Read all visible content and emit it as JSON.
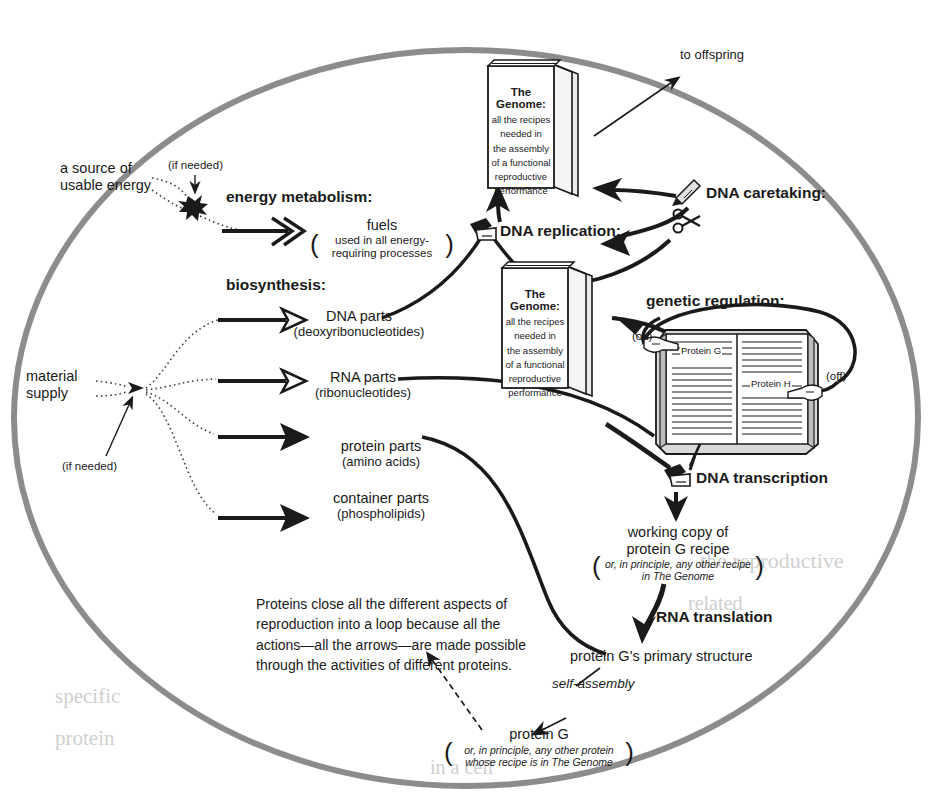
{
  "diagram": {
    "membrane_color": "#8c8c8c",
    "ink_color": "#1a1a1a"
  },
  "labels": {
    "to_offspring": "to offspring",
    "source_energy_l1": "a source of",
    "source_energy_l2": "usable energy",
    "if_needed_energy": "(if needed)",
    "energy_metabolism": "energy metabolism:",
    "biosynthesis": "biosynthesis:",
    "material_supply_l1": "material",
    "material_supply_l2": "supply",
    "if_needed_material": "(if needed)",
    "dna_replication": "DNA replication:",
    "dna_caretaking": "DNA caretaking:",
    "genetic_regulation": "genetic regulation:",
    "dna_transcription": "DNA transcription",
    "rna_translation": "RNA translation",
    "self_assembly": "self-assembly",
    "on": "(on)",
    "off": "(off)",
    "protein_g_page": "Protein G",
    "protein_h_page": "Protein H"
  },
  "products": [
    {
      "name": "fuels",
      "sub_l1": "used in all energy-",
      "sub_l2": "requiring processes",
      "arrow": "double-chevron"
    },
    {
      "name": "DNA parts",
      "sub_l1": "(deoxyribonucleotides)",
      "sub_l2": "",
      "arrow": "open-head"
    },
    {
      "name": "RNA parts",
      "sub_l1": "(ribonucleotides)",
      "sub_l2": "",
      "arrow": "open-head"
    },
    {
      "name": "protein parts",
      "sub_l1": "(amino acids)",
      "sub_l2": "",
      "arrow": "solid-head"
    },
    {
      "name": "container parts",
      "sub_l1": "(phospholipids)",
      "sub_l2": "",
      "arrow": "solid-head"
    }
  ],
  "genome_book": {
    "title": "The Genome:",
    "lines": [
      "all the recipes",
      "needed in",
      "the assembly",
      "of a functional",
      "reproductive",
      "performance"
    ]
  },
  "transcription_chain": {
    "working_copy_l1": "working copy of",
    "working_copy_l2": "protein G recipe",
    "working_copy_paren_l1": "or, in principle, any other recipe",
    "working_copy_paren_l2": "in The Genome",
    "primary_structure": "protein G's primary structure",
    "protein_g": "protein G",
    "protein_g_paren_l1": "or, in principle, any other protein",
    "protein_g_paren_l2": "whose recipe is in The Genome"
  },
  "note": {
    "line1": "Proteins close all the different aspects of",
    "line2": "reproduction into a loop because all the",
    "line3": "actions—all the arrows—are made possible",
    "line4": "through the activities of different proteins."
  },
  "icons": {
    "writing_hand": "writing-hand-icon",
    "pencil": "pencil-icon",
    "scissors": "scissors-icon",
    "pointing_hand_on": "pointing-hand-icon",
    "pointing_hand_off": "pointing-hand-icon"
  },
  "bleed_text": [
    {
      "t": "the reproductive",
      "x": 700,
      "y": 560,
      "s": 22
    },
    {
      "t": "related",
      "x": 690,
      "y": 600,
      "s": 20
    },
    {
      "t": "specific",
      "x": 60,
      "y": 690,
      "s": 21
    },
    {
      "t": "protein",
      "x": 60,
      "y": 730,
      "s": 21
    },
    {
      "t": "in a cell",
      "x": 430,
      "y": 760,
      "s": 20
    }
  ]
}
